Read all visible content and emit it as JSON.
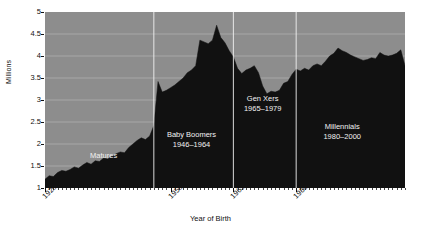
{
  "chart_data": {
    "type": "area",
    "title": "",
    "xlabel": "Year of Birth",
    "ylabel": "Millions",
    "xlim": [
      1920,
      2006
    ],
    "ylim": [
      1,
      5
    ],
    "grid": true,
    "legend_position": "none",
    "fill_color": "#111111",
    "plot_background": "#8d8d8d",
    "gridline_color": "#b5b5b5",
    "annotation_color": "#f2f2f2",
    "y_ticks": [
      "1",
      "1.5",
      "2",
      "2.5",
      "3",
      "3.5",
      "4",
      "4.5",
      "5"
    ],
    "y_tick_values": [
      1,
      1.5,
      2,
      2.5,
      3,
      3.5,
      4,
      4.5,
      5
    ],
    "x_ticks": [
      "1920",
      "1950",
      "1965",
      "1980"
    ],
    "x_tick_values": [
      1920,
      1950,
      1965,
      1980
    ],
    "x_minor_tick_interval": 1,
    "x": [
      1920,
      1921,
      1922,
      1923,
      1924,
      1925,
      1926,
      1927,
      1928,
      1929,
      1930,
      1931,
      1932,
      1933,
      1934,
      1935,
      1936,
      1937,
      1938,
      1939,
      1940,
      1941,
      1942,
      1943,
      1944,
      1945,
      1946,
      1947,
      1948,
      1949,
      1950,
      1951,
      1952,
      1953,
      1954,
      1955,
      1956,
      1957,
      1958,
      1959,
      1960,
      1961,
      1962,
      1963,
      1964,
      1965,
      1966,
      1967,
      1968,
      1969,
      1970,
      1971,
      1972,
      1973,
      1974,
      1975,
      1976,
      1977,
      1978,
      1979,
      1980,
      1981,
      1982,
      1983,
      1984,
      1985,
      1986,
      1987,
      1988,
      1989,
      1990,
      1991,
      1992,
      1993,
      1994,
      1995,
      1996,
      1997,
      1998,
      1999,
      2000,
      2001,
      2002,
      2003,
      2004,
      2005,
      2006
    ],
    "values": [
      1.2,
      1.28,
      1.26,
      1.35,
      1.4,
      1.38,
      1.42,
      1.48,
      1.45,
      1.52,
      1.58,
      1.54,
      1.62,
      1.6,
      1.68,
      1.66,
      1.72,
      1.78,
      1.82,
      1.8,
      1.92,
      2.0,
      2.08,
      2.14,
      2.1,
      2.18,
      2.42,
      3.42,
      3.18,
      3.22,
      3.28,
      3.34,
      3.42,
      3.5,
      3.62,
      3.68,
      3.78,
      4.36,
      4.32,
      4.28,
      4.36,
      4.7,
      4.42,
      4.3,
      4.12,
      3.98,
      3.72,
      3.6,
      3.68,
      3.72,
      3.78,
      3.62,
      3.32,
      3.14,
      3.2,
      3.18,
      3.22,
      3.38,
      3.42,
      3.58,
      3.7,
      3.66,
      3.72,
      3.68,
      3.78,
      3.82,
      3.78,
      3.88,
      4.0,
      4.06,
      4.18,
      4.12,
      4.08,
      4.02,
      3.98,
      3.94,
      3.9,
      3.92,
      3.96,
      3.94,
      4.08,
      4.02,
      4.0,
      4.02,
      4.06,
      4.14,
      3.78
    ],
    "annotations": [
      {
        "label": "Matures",
        "years": "",
        "x_center": 1934,
        "y_center": 1.72
      },
      {
        "label": "Baby Boomers",
        "years": "1946–1964",
        "x_center": 1955,
        "y_center": 2.1
      },
      {
        "label": "Gen Xers",
        "years": "1965–1979",
        "x_center": 1972,
        "y_center": 2.92
      },
      {
        "label": "Millennials",
        "years": "1980–2000",
        "x_center": 1991,
        "y_center": 2.28
      }
    ],
    "divider_years": [
      1946,
      1965,
      1980
    ]
  }
}
